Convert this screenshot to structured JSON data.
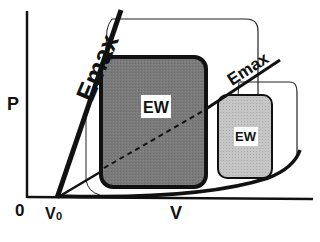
{
  "diagram": {
    "type": "pressure-volume loop diagram",
    "axes": {
      "y_label": "P",
      "x_label": "V",
      "origin_label": "0",
      "v0_label": "V",
      "v0_subscript": "0"
    },
    "lines": [
      {
        "name": "Emax",
        "style": "thick",
        "label": "Emax",
        "position": "steep"
      },
      {
        "name": "Emax",
        "style": "thin",
        "label": "Emax",
        "position": "shallow"
      }
    ],
    "loops": [
      {
        "label": "EW",
        "fill": "#7a7a7a",
        "size": "large"
      },
      {
        "label": "EW",
        "fill": "#c4c4c4",
        "size": "small"
      }
    ],
    "colors": {
      "background": "#ffffff",
      "stroke": "#111111",
      "large_loop_fill": "#7a7a7a",
      "small_loop_fill": "#c4c4c4",
      "label_box": "#ffffff"
    }
  }
}
